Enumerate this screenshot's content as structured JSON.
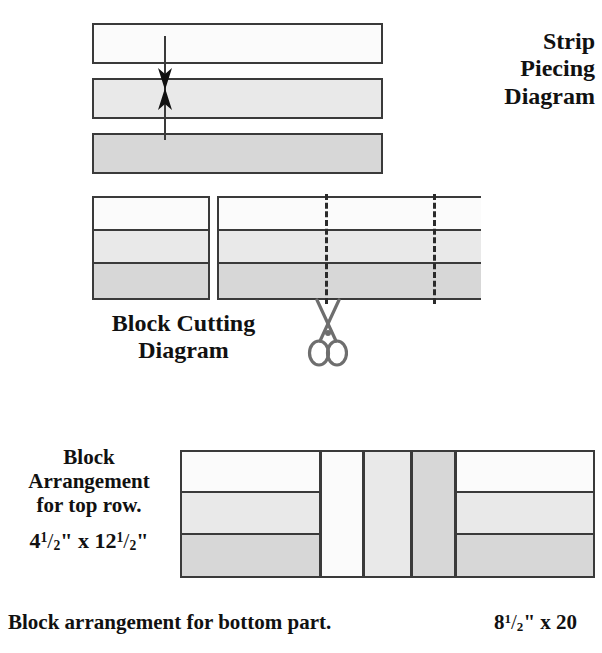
{
  "page": {
    "background": "#ffffff",
    "width": 602,
    "height": 653
  },
  "palette": {
    "fabric_white": "#fbfbfb",
    "fabric_light": "#e9e9e9",
    "fabric_medium": "#d7d7d7",
    "outline": "#3a3a3a",
    "cutline": "#2b2b2b",
    "scissors": "#6e6e6e",
    "text": "#111111"
  },
  "strip_piecing": {
    "title_lines": [
      "Strip",
      "Piecing",
      "Diagram"
    ],
    "title_full": "Strip Piecing Diagram",
    "strips": [
      {
        "tone": "white",
        "name": "strip-white"
      },
      {
        "tone": "light",
        "name": "strip-light"
      },
      {
        "tone": "medium",
        "name": "strip-medium"
      }
    ],
    "arrow": {
      "name": "seam-direction-arrow",
      "style": "double-headed-vertical"
    }
  },
  "block_cutting": {
    "title_lines": [
      "Block Cutting",
      "Diagram"
    ],
    "title_full": "Block Cutting Diagram",
    "single_block": {
      "name": "cut-block-single",
      "bands": [
        "white",
        "light",
        "medium"
      ]
    },
    "strip_set": {
      "name": "cut-block-strip-set",
      "bands": [
        "white",
        "light",
        "medium"
      ],
      "cut_lines": 2
    },
    "scissors_icon": "scissors-icon"
  },
  "block_arrangement_top": {
    "title_lines": [
      "Block",
      "Arrangement",
      "for top row."
    ],
    "title_full": "Block Arrangement for top row.",
    "dimension": {
      "whole_1": "4",
      "num_1": "1",
      "den_1": "2",
      "unit_1": "\"",
      "times": "x",
      "whole_2": "12",
      "num_2": "1",
      "den_2": "2",
      "unit_2": "\"",
      "plain": "4 1/2\" x 12 1/2\""
    },
    "units": [
      {
        "name": "arrangement-block-left",
        "type": "banded-block",
        "bands": [
          "white",
          "light",
          "medium"
        ]
      },
      {
        "name": "arrangement-strip-white",
        "type": "vertical-strip",
        "tone": "white"
      },
      {
        "name": "arrangement-strip-light",
        "type": "vertical-strip",
        "tone": "light"
      },
      {
        "name": "arrangement-strip-medium",
        "type": "vertical-strip",
        "tone": "medium"
      },
      {
        "name": "arrangement-block-right",
        "type": "banded-block",
        "bands": [
          "white",
          "light",
          "medium"
        ]
      }
    ]
  },
  "footer": {
    "caption": "Block arrangement for bottom part.",
    "dimension": {
      "whole_1": "8",
      "num_1": "1",
      "den_1": "2",
      "unit_1": "\"",
      "times": "x",
      "whole_2": "20",
      "plain": "8 1/2\" x 20"
    }
  }
}
